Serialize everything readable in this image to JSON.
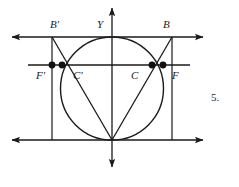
{
  "figure": {
    "kind": "geometry-diagram",
    "problem_number": "5.",
    "stroke_color": "#1a1a1a",
    "background_color": "#ffffff",
    "labels": [
      {
        "id": "B-prime",
        "text": "B'",
        "x": 50,
        "y": 19
      },
      {
        "id": "Y",
        "text": "Y",
        "x": 97,
        "y": 19
      },
      {
        "id": "B",
        "text": "B",
        "x": 163,
        "y": 19
      },
      {
        "id": "F-prime",
        "text": "F'",
        "x": 36,
        "y": 70
      },
      {
        "id": "C-prime",
        "text": "C'",
        "x": 73,
        "y": 70
      },
      {
        "id": "C",
        "text": "C",
        "x": 131,
        "y": 70
      },
      {
        "id": "F",
        "text": "F",
        "x": 172,
        "y": 70
      }
    ],
    "points": [
      {
        "id": "point-F-prime",
        "x": 52,
        "y": 65
      },
      {
        "id": "point-C-prime",
        "x": 62,
        "y": 65
      },
      {
        "id": "point-C",
        "x": 152,
        "y": 65
      },
      {
        "id": "point-F",
        "x": 163,
        "y": 65
      }
    ],
    "circle": {
      "cx": 112,
      "cy": 88.5,
      "r": 51.5
    },
    "axis_vertical": {
      "x": 112,
      "y1": 3,
      "y2": 172
    },
    "line_top": {
      "y": 37,
      "x1": 8,
      "x2": 207
    },
    "line_middle": {
      "y": 65,
      "x1": 28,
      "x2": 190
    },
    "line_bottom": {
      "y": 140,
      "x1": 8,
      "x2": 207
    },
    "line_left_vertical": {
      "x": 52,
      "y1": 37,
      "y2": 140
    },
    "line_right_vertical": {
      "x": 172,
      "y1": 37,
      "y2": 140
    },
    "chord_left": {
      "x1": 112,
      "y1": 140,
      "x2": 52,
      "y2": 37
    },
    "chord_right": {
      "x1": 112,
      "y1": 140,
      "x2": 172,
      "y2": 37
    }
  }
}
